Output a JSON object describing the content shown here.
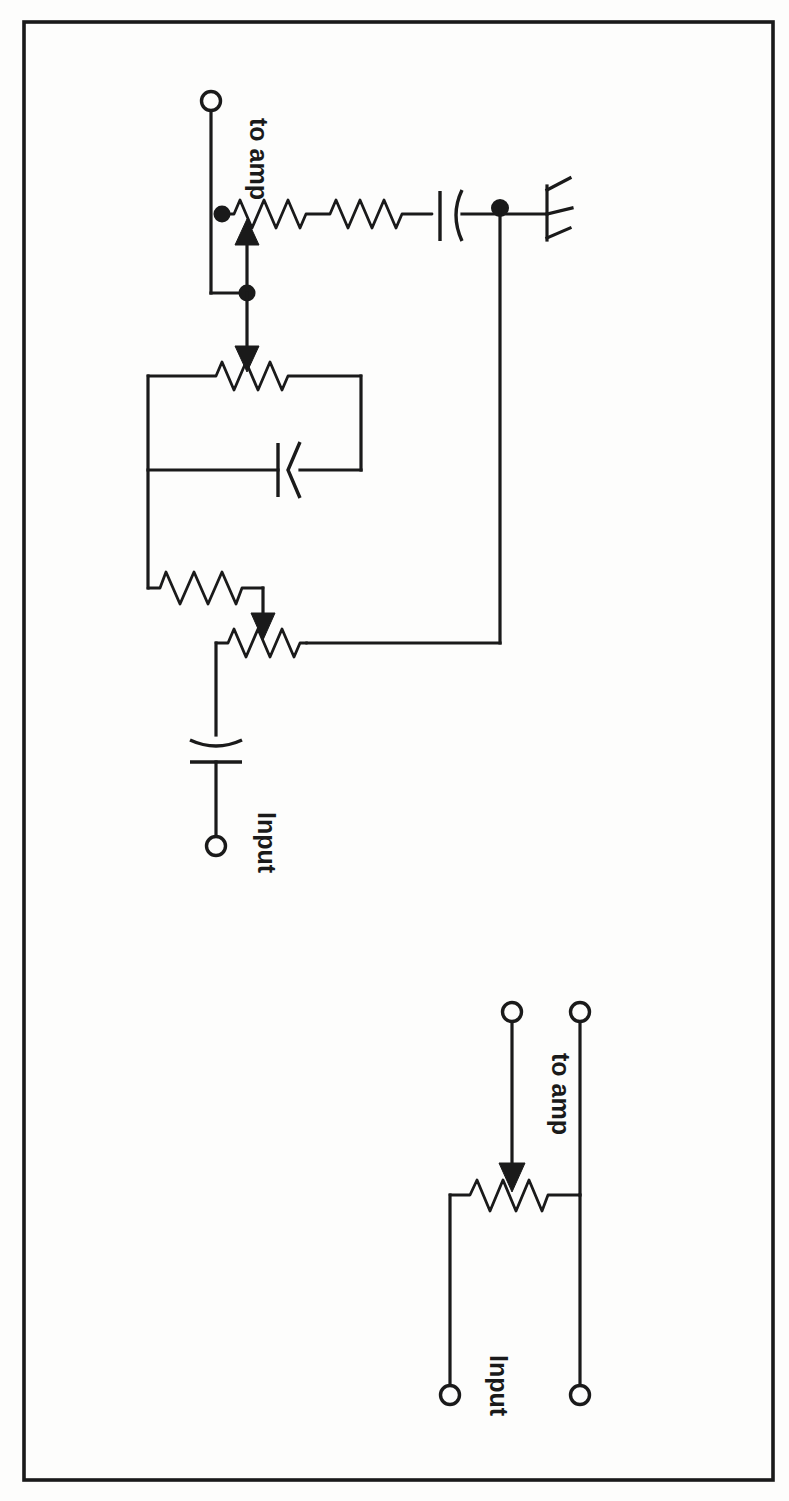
{
  "figure": {
    "kind": "electronic-schematic",
    "title": "",
    "ink_color": "#1a1a1a",
    "paper_color": "#fdfdfc",
    "orientation": "rotated-90-clockwise",
    "border": {
      "x": 24,
      "y": 22,
      "width": 749,
      "height": 1458
    }
  },
  "labels": {
    "top_to_amp": "to amp",
    "top_input": "Input",
    "bottom_to_amp": "to amp",
    "bottom_input": "Input"
  },
  "circuits": [
    {
      "id": "upper-circuit",
      "name": "tone-control-network",
      "components": [
        {
          "type": "terminal",
          "name": "to-amp-terminal",
          "label": "to amp"
        },
        {
          "type": "potentiometer",
          "name": "treble-pot",
          "wiper": "up"
        },
        {
          "type": "capacitor",
          "name": "treble-coupling-cap",
          "style": "curved-plate"
        },
        {
          "type": "ground",
          "name": "ground-symbol"
        },
        {
          "type": "junction",
          "name": "junction-dot",
          "count": 3
        },
        {
          "type": "potentiometer",
          "name": "bass-pot",
          "wiper": "down"
        },
        {
          "type": "capacitor",
          "name": "bass-shunt-cap",
          "style": "curved-plate"
        },
        {
          "type": "resistor",
          "name": "series-resistor"
        },
        {
          "type": "potentiometer",
          "name": "volume-pot",
          "wiper": "down"
        },
        {
          "type": "capacitor",
          "name": "input-coupling-cap",
          "style": "curved-plate"
        },
        {
          "type": "terminal",
          "name": "input-terminal",
          "label": "Input"
        }
      ]
    },
    {
      "id": "lower-circuit",
      "name": "simple-volume-control",
      "components": [
        {
          "type": "terminal",
          "name": "to-amp-terminal",
          "label": "to amp"
        },
        {
          "type": "terminal",
          "name": "to-amp-return-terminal",
          "label": ""
        },
        {
          "type": "potentiometer",
          "name": "volume-pot",
          "wiper": "down"
        },
        {
          "type": "terminal",
          "name": "input-terminal",
          "label": "Input"
        },
        {
          "type": "terminal",
          "name": "input-return-terminal",
          "label": ""
        }
      ]
    }
  ]
}
